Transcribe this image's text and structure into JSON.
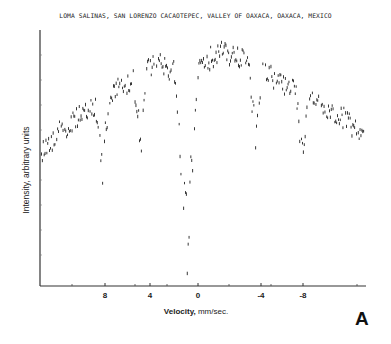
{
  "chart_data": {
    "type": "scatter",
    "title": "LOMA SALINAS, SAN LORENZO CACAOTEPEC, VALLEY OF OAXACA, OAXACA, MEXICO",
    "xlabel_bold": "Velocity,",
    "xlabel_rest": " mm/sec.",
    "ylabel": "Intensity, arbitrary units",
    "panel_letter": "A",
    "x_ticks": [
      {
        "label": "8",
        "px": 105
      },
      {
        "label": "4",
        "px": 150
      },
      {
        "label": "0",
        "px": 198
      },
      {
        "label": "-4",
        "px": 261
      },
      {
        "label": "-8",
        "px": 303
      }
    ],
    "x_minor_ticks_px": [
      72,
      135,
      167,
      229,
      271,
      357
    ],
    "y_minor_ticks_px": [
      55,
      80,
      105,
      130,
      155,
      180,
      205,
      230,
      255
    ],
    "xlim_note": "velocity axis reversed: positive left, negative right",
    "grid": false,
    "legend": null,
    "baseline_envelope": {
      "description": "intensity envelope (px) vs x(px): rises from left edge to two central maxima then falls toward right",
      "points": [
        [
          40,
          150
        ],
        [
          60,
          130
        ],
        [
          80,
          115
        ],
        [
          100,
          100
        ],
        [
          120,
          85
        ],
        [
          140,
          72
        ],
        [
          160,
          62
        ],
        [
          175,
          72
        ],
        [
          190,
          75
        ],
        [
          205,
          60
        ],
        [
          220,
          50
        ],
        [
          240,
          58
        ],
        [
          260,
          70
        ],
        [
          280,
          80
        ],
        [
          300,
          92
        ],
        [
          320,
          102
        ],
        [
          340,
          115
        ],
        [
          362,
          132
        ]
      ]
    },
    "absorption_dips": [
      {
        "x_px": 102,
        "depth_px": 175,
        "width_px": 3
      },
      {
        "x_px": 140,
        "depth_px": 150,
        "width_px": 3
      },
      {
        "x_px": 186,
        "depth_px": 283,
        "width_px": 5
      },
      {
        "x_px": 255,
        "depth_px": 153,
        "width_px": 3
      },
      {
        "x_px": 302,
        "depth_px": 163,
        "width_px": 3
      }
    ],
    "plot_area_px": {
      "left": 40,
      "top": 30,
      "right": 366,
      "bottom": 286
    }
  }
}
